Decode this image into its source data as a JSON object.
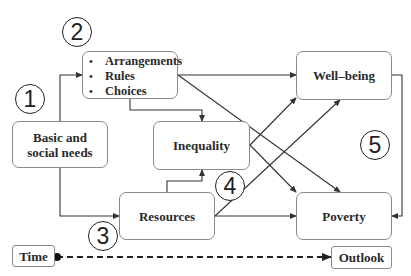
{
  "diagram": {
    "nodes": {
      "arrangements": {
        "items": [
          "Arrangements",
          "Rules",
          "Choices"
        ]
      },
      "basic_needs": {
        "label_line1": "Basic and",
        "label_line2": "social needs"
      },
      "inequality": {
        "label": "Inequality"
      },
      "resources": {
        "label": "Resources"
      },
      "wellbeing": {
        "label": "Well–being"
      },
      "poverty": {
        "label": "Poverty"
      },
      "time": {
        "label": "Time"
      },
      "outlook": {
        "label": "Outlook"
      }
    },
    "markers": [
      "1",
      "2",
      "3",
      "4",
      "5"
    ],
    "edges": [
      {
        "from": "Basic and social needs",
        "to": "Arrangements/Rules/Choices"
      },
      {
        "from": "Basic and social needs",
        "to": "Resources"
      },
      {
        "from": "Arrangements/Rules/Choices",
        "to": "Well-being"
      },
      {
        "from": "Arrangements/Rules/Choices",
        "to": "Inequality"
      },
      {
        "from": "Arrangements/Rules/Choices",
        "to": "Poverty"
      },
      {
        "from": "Resources",
        "to": "Inequality"
      },
      {
        "from": "Resources",
        "to": "Well-being"
      },
      {
        "from": "Resources",
        "to": "Poverty"
      },
      {
        "from": "Inequality",
        "to": "Well-being"
      },
      {
        "from": "Inequality",
        "to": "Poverty"
      },
      {
        "from": "Well-being",
        "to": "Poverty",
        "bidirectional": true
      },
      {
        "from": "Time",
        "to": "Outlook",
        "style": "dashed"
      }
    ]
  }
}
